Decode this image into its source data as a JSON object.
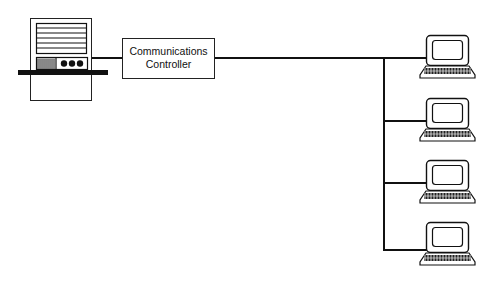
{
  "diagram": {
    "type": "network-topology",
    "host": {
      "name": "host-computer",
      "label": ""
    },
    "controller": {
      "line1": "Communications",
      "line2": "Controller"
    },
    "terminals": [
      {
        "name": "terminal-1"
      },
      {
        "name": "terminal-2"
      },
      {
        "name": "terminal-3"
      },
      {
        "name": "terminal-4"
      }
    ],
    "colors": {
      "stroke": "#111111",
      "background": "#ffffff"
    }
  }
}
